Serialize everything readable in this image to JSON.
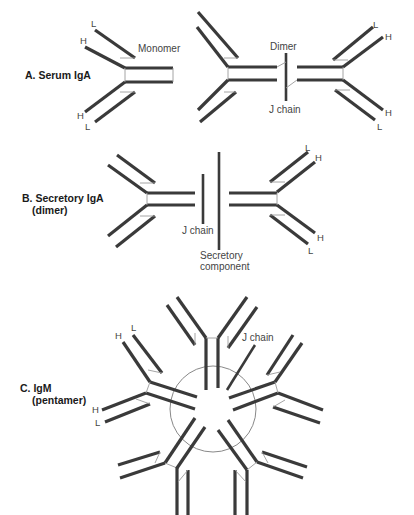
{
  "figure": {
    "background": "#ffffff",
    "chain_color": "#3a3a3a",
    "panels": [
      {
        "id": "A",
        "label": "A. Serum IgA",
        "annotations": {
          "monomer": "Monomer",
          "dimer": "Dimer",
          "j_chain": "J chain"
        },
        "chain_labels": {
          "heavy": "H",
          "light": "L"
        }
      },
      {
        "id": "B",
        "label_line1": "B. Secretory IgA",
        "label_line2": "(dimer)",
        "annotations": {
          "j_chain": "J chain",
          "secretory_line1": "Secretory",
          "secretory_line2": "component"
        },
        "chain_labels": {
          "heavy": "H",
          "light": "L"
        }
      },
      {
        "id": "C",
        "label_line1": "C. IgM",
        "label_line2": "(pentamer)",
        "annotations": {
          "j_chain": "J chain"
        },
        "chain_labels": {
          "heavy": "H",
          "light": "L"
        }
      }
    ]
  }
}
